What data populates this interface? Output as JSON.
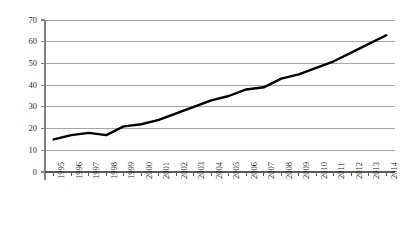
{
  "chart_data": {
    "type": "line",
    "title": "",
    "subtitle": "",
    "xlabel": "",
    "ylabel": "",
    "categories": [
      "1995",
      "1996",
      "1997",
      "1998",
      "1999",
      "2000",
      "2001",
      "2002",
      "2003",
      "2004",
      "2005",
      "2006",
      "2007",
      "2008",
      "2009",
      "2010",
      "2011",
      "2012",
      "2013",
      "2014"
    ],
    "values": [
      15,
      17,
      18,
      17,
      21,
      22,
      24,
      27,
      30,
      33,
      35,
      38,
      39,
      43,
      45,
      48,
      51,
      55,
      59,
      63
    ],
    "ylim": [
      0,
      70
    ],
    "ytick_labels": [
      "0",
      "10",
      "20",
      "30",
      "40",
      "50",
      "60",
      "70"
    ],
    "ytick_values": [
      0,
      10,
      20,
      30,
      40,
      50,
      60,
      70
    ],
    "grid": true,
    "grid_axis": "y",
    "legend": false,
    "legend_position": "none",
    "series": [
      {
        "name": "",
        "values": [
          15,
          17,
          18,
          17,
          21,
          22,
          24,
          27,
          30,
          33,
          35,
          38,
          39,
          43,
          45,
          48,
          51,
          55,
          59,
          63
        ]
      }
    ],
    "colors": {
      "line": "#000000",
      "grid": "#a6a6a6",
      "axis": "#808080",
      "text": "#2b2b2b",
      "background": "#ffffff"
    },
    "line_width": 2.4,
    "markers": false
  }
}
